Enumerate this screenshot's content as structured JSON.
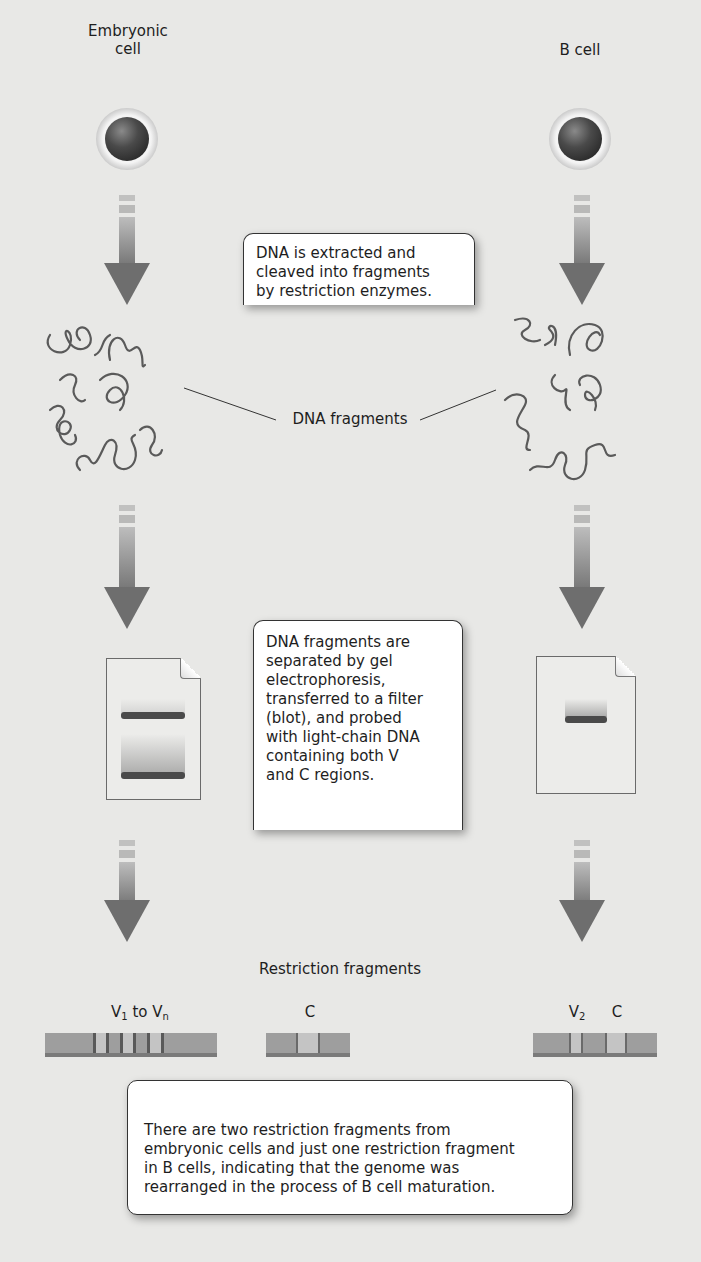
{
  "left_column": {
    "cell_label_line1": "Embryonic",
    "cell_label_line2": "cell"
  },
  "right_column": {
    "cell_label": "B cell"
  },
  "callouts": {
    "extraction": [
      "DNA is extracted and",
      "cleaved into fragments",
      "by restriction enzymes."
    ],
    "blot": [
      "DNA fragments are",
      "separated by gel",
      "electrophoresis,",
      "transferred to a filter",
      "(blot), and probed",
      "with light-chain DNA",
      "containing both V",
      "and C regions."
    ],
    "conclusion": [
      "There are two restriction fragments from",
      "embryonic cells and just one restriction fragment",
      "in B cells, indicating that the genome was",
      "rearranged in the process of B cell maturation."
    ]
  },
  "labels": {
    "dna_fragments": "DNA fragments",
    "restriction_fragments": "Restriction fragments",
    "v1": "V",
    "v1_sub": "1",
    "to": " to V",
    "vn_sub": "n",
    "c_left": "C",
    "v2": "V",
    "v2_sub": "2",
    "c_right": "C"
  },
  "gels": {
    "embryonic_bands": 2,
    "bcell_bands": 1
  },
  "colors": {
    "background": "#e8e8e6",
    "arrow": "#6e6e6e",
    "band": "#4a4a4a",
    "fragment": "#9e9e9e",
    "fragment_light": "#c4c4c4"
  }
}
